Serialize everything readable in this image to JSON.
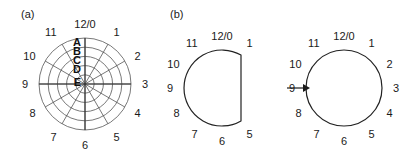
{
  "figure": {
    "panels": [
      {
        "id": "a",
        "label": "(a)"
      },
      {
        "id": "b",
        "label": "(b)"
      }
    ]
  },
  "panel_a": {
    "type": "polar-clock-grid",
    "clock_labels": [
      "12/0",
      "1",
      "2",
      "3",
      "4",
      "5",
      "6",
      "7",
      "8",
      "9",
      "10",
      "11"
    ],
    "ring_labels": [
      "A",
      "B",
      "C",
      "D",
      "E"
    ],
    "ring_count": 5,
    "spoke_count": 12,
    "center": {
      "x": 85,
      "y": 84
    },
    "outer_radius": 46,
    "colors": {
      "grid": "#555555",
      "axis": "#333333",
      "text": "#1a1a1a"
    }
  },
  "panel_b": {
    "type": "shape-transformation",
    "left_shape": {
      "name": "d-shape-contour",
      "description": "circle flattened on right side between positions 1 and 5",
      "clock_labels": [
        "12/0",
        "1",
        "5",
        "6",
        "7",
        "8",
        "9",
        "10",
        "11"
      ],
      "center": {
        "x": 222,
        "y": 88
      },
      "radius": 38
    },
    "right_shape": {
      "name": "circle-contour",
      "description": "full circle",
      "clock_labels": [
        "12/0",
        "1",
        "2",
        "3",
        "4",
        "5",
        "6",
        "7",
        "8",
        "9",
        "10",
        "11"
      ],
      "center": {
        "x": 344,
        "y": 88
      },
      "radius": 38
    },
    "arrow": {
      "name": "transform-arrow",
      "from_x": 287,
      "to_x": 310,
      "y": 88
    },
    "colors": {
      "contour": "#222222",
      "arrow": "#1a1a1a"
    }
  }
}
